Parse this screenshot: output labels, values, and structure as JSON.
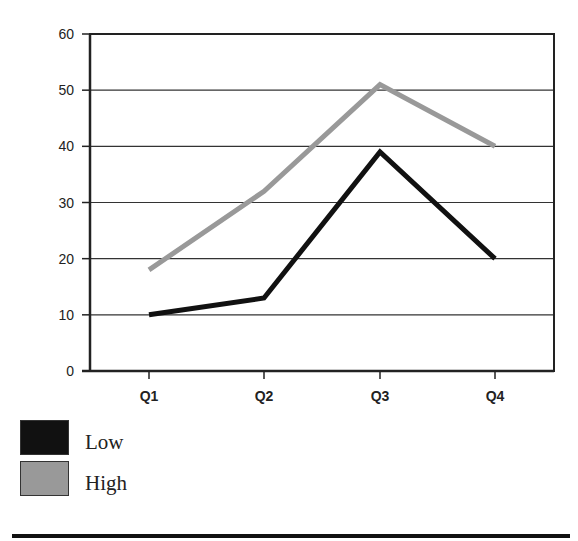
{
  "chart_data": {
    "type": "line",
    "title": "",
    "xlabel": "",
    "ylabel": "",
    "categories": [
      "Q1",
      "Q2",
      "Q3",
      "Q4"
    ],
    "series": [
      {
        "name": "Low",
        "values": [
          10,
          13,
          39,
          20
        ],
        "color": "#111111"
      },
      {
        "name": "High",
        "values": [
          18,
          32,
          51,
          40
        ],
        "color": "#999999"
      }
    ],
    "ylim": [
      0,
      60
    ],
    "yticks": [
      0,
      10,
      20,
      30,
      40,
      50,
      60
    ],
    "grid": true,
    "legend_position": "bottom-left"
  },
  "legend": {
    "items": [
      {
        "label": "Low",
        "color": "#111111"
      },
      {
        "label": "High",
        "color": "#999999"
      }
    ]
  }
}
